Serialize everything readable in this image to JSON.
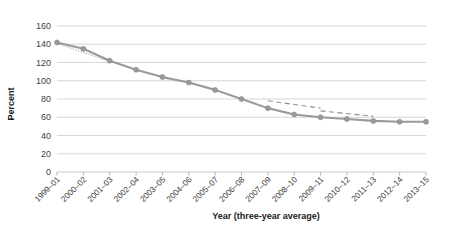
{
  "chart_data": {
    "type": "line",
    "title": "",
    "xlabel": "Year (three-year average)",
    "ylabel": "Percent",
    "ylim": [
      0,
      160
    ],
    "ytick_step": 20,
    "yticks": [
      0,
      20,
      40,
      60,
      80,
      100,
      120,
      140,
      160
    ],
    "grid": true,
    "legend": "none",
    "categories": [
      "1999–01",
      "2000–02",
      "2001–03",
      "2002–04",
      "2003–05",
      "2004–06",
      "2005–07",
      "2006–08",
      "2007–09",
      "2008–10",
      "2009–11",
      "2010–12",
      "2011–13",
      "2012–14",
      "2013–15"
    ],
    "series": [
      {
        "name": "Percent",
        "marker": "circle",
        "color": "#9a9a9a",
        "values": [
          142,
          135,
          122,
          112,
          104,
          98,
          90,
          80,
          70,
          63,
          60,
          58,
          56,
          55,
          55
        ]
      }
    ],
    "trend_segments": [
      {
        "name": "early-trend",
        "style": "dotted",
        "color": "#a8a8a8",
        "x_from": "1999–01",
        "x_to": "2001–03",
        "y_from": 141,
        "y_to": 121
      },
      {
        "name": "mid-trend",
        "style": "dashed",
        "color": "#8f8f8f",
        "x_from": "2007–09",
        "x_to": "2009–11",
        "y_from": 78,
        "y_to": 70
      },
      {
        "name": "late-trend",
        "style": "dashed",
        "color": "#8f8f8f",
        "x_from": "2009–11",
        "x_to": "2011–13",
        "y_from": 67,
        "y_to": 61
      }
    ]
  },
  "axes": {
    "y_title": "Percent",
    "x_title": "Year (three-year average)"
  }
}
